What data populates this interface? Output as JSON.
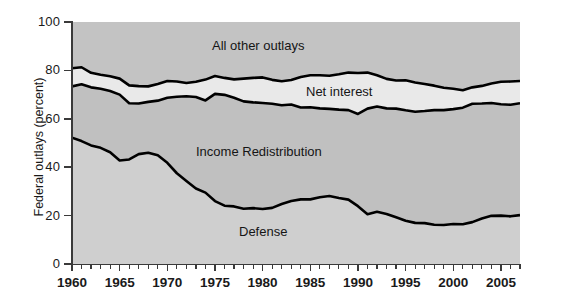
{
  "chart_data": {
    "type": "area",
    "title": "",
    "xlabel": "",
    "ylabel": "Federal outlays (percent)",
    "xlim": [
      1960,
      2007
    ],
    "ylim": [
      0,
      100
    ],
    "ytick_labels": [
      "0",
      "20",
      "40",
      "60",
      "80",
      "100"
    ],
    "ytick_values": [
      0,
      20,
      40,
      60,
      80,
      100
    ],
    "xtick_labels": [
      "1960",
      "1965",
      "1970",
      "1975",
      "1980",
      "1985",
      "1990",
      "1995",
      "2000",
      "2005"
    ],
    "xtick_values": [
      1960,
      1965,
      1970,
      1975,
      1980,
      1985,
      1990,
      1995,
      2000,
      2005
    ],
    "minor_ticks": true,
    "grid": false,
    "legend_position": "inline-annotations",
    "annotations": [
      {
        "text": "All other outlays",
        "x": 1983,
        "y": 91
      },
      {
        "text": "Net interest",
        "x": 1994,
        "y": 72
      },
      {
        "text": "Income Redistribution",
        "x": 1981,
        "y": 48
      },
      {
        "text": "Defense",
        "x": 1984,
        "y": 14
      }
    ],
    "colors": {
      "all_other_outlays": "#c3c3c3",
      "net_interest": "#e9e9e9",
      "income_redistribution": "#c0c0c0",
      "defense": "#cfcfcf",
      "line": "#000000",
      "plot_background": "#c9c9c9",
      "axis": "#3a3a3a",
      "text": "#1a1a1a"
    },
    "x": [
      1960,
      1961,
      1962,
      1963,
      1964,
      1965,
      1966,
      1967,
      1968,
      1969,
      1970,
      1971,
      1972,
      1973,
      1974,
      1975,
      1976,
      1977,
      1978,
      1979,
      1980,
      1981,
      1982,
      1983,
      1984,
      1985,
      1986,
      1987,
      1988,
      1989,
      1990,
      1991,
      1992,
      1993,
      1994,
      1995,
      1996,
      1997,
      1998,
      1999,
      2000,
      2001,
      2002,
      2003,
      2004,
      2005,
      2006,
      2007
    ],
    "series": [
      {
        "name": "Defense",
        "description": "Cumulative boundary: Defense share of federal outlays",
        "values": [
          52.2,
          50.8,
          49.0,
          48.0,
          46.2,
          42.8,
          43.2,
          45.4,
          46.0,
          44.9,
          41.8,
          37.5,
          34.3,
          31.2,
          29.5,
          26.0,
          24.1,
          23.8,
          22.8,
          23.1,
          22.7,
          23.2,
          24.8,
          26.0,
          26.7,
          26.7,
          27.6,
          28.1,
          27.3,
          26.6,
          23.9,
          20.6,
          21.6,
          20.7,
          19.3,
          17.9,
          17.0,
          16.9,
          16.2,
          16.1,
          16.5,
          16.4,
          17.3,
          18.8,
          19.9,
          20.0,
          19.7,
          20.2
        ]
      },
      {
        "name": "Income Redistribution",
        "description": "Cumulative boundary: Defense + Income Redistribution",
        "values": [
          73.4,
          74.3,
          73.0,
          72.4,
          71.5,
          70.0,
          66.4,
          66.3,
          67.0,
          67.5,
          68.7,
          69.1,
          69.3,
          69.0,
          67.6,
          70.3,
          69.9,
          68.7,
          67.2,
          66.8,
          66.5,
          66.2,
          65.6,
          65.9,
          64.7,
          64.8,
          64.3,
          64.1,
          63.8,
          63.6,
          62.0,
          64.2,
          65.1,
          64.3,
          64.2,
          63.5,
          62.9,
          63.2,
          63.6,
          63.6,
          64.0,
          64.6,
          66.2,
          66.3,
          66.5,
          66.0,
          65.8,
          66.4
        ]
      },
      {
        "name": "Net interest",
        "description": "Cumulative boundary: Defense + Income Redistribution + Net interest",
        "values": [
          80.9,
          81.3,
          79.0,
          78.2,
          77.6,
          76.6,
          73.8,
          73.5,
          73.4,
          74.4,
          75.6,
          75.4,
          74.8,
          75.3,
          76.2,
          77.7,
          76.9,
          76.3,
          76.6,
          76.9,
          77.1,
          76.1,
          75.5,
          76.0,
          77.3,
          78.0,
          78.0,
          77.8,
          78.4,
          79.1,
          78.9,
          79.1,
          78.0,
          76.5,
          75.8,
          75.9,
          75.0,
          74.4,
          73.7,
          72.8,
          72.4,
          71.8,
          73.0,
          73.6,
          74.6,
          75.3,
          75.4,
          75.6
        ]
      },
      {
        "name": "All other outlays",
        "description": "Remaining share up to 100 percent",
        "values": [
          100,
          100,
          100,
          100,
          100,
          100,
          100,
          100,
          100,
          100,
          100,
          100,
          100,
          100,
          100,
          100,
          100,
          100,
          100,
          100,
          100,
          100,
          100,
          100,
          100,
          100,
          100,
          100,
          100,
          100,
          100,
          100,
          100,
          100,
          100,
          100,
          100,
          100,
          100,
          100,
          100,
          100,
          100,
          100,
          100,
          100,
          100,
          100
        ]
      }
    ]
  }
}
